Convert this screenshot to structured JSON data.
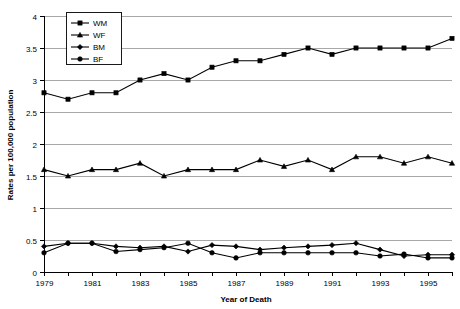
{
  "chart_data": {
    "type": "line",
    "title": "",
    "xlabel": "Year of Death",
    "ylabel": "Rates per 100,000 population",
    "x": [
      1979,
      1980,
      1981,
      1982,
      1983,
      1984,
      1985,
      1986,
      1987,
      1988,
      1989,
      1990,
      1991,
      1992,
      1993,
      1994,
      1995,
      1996
    ],
    "xtick_labels": [
      "1979",
      "1981",
      "1983",
      "1985",
      "1987",
      "1989",
      "1991",
      "1993",
      "1995"
    ],
    "xtick_values": [
      1979,
      1981,
      1983,
      1985,
      1987,
      1989,
      1991,
      1993,
      1995
    ],
    "ytick_labels": [
      "0",
      "0.5",
      "1",
      "1.5",
      "2",
      "2.5",
      "3",
      "3.5",
      "4"
    ],
    "ytick_values": [
      0,
      0.5,
      1,
      1.5,
      2,
      2.5,
      3,
      3.5,
      4
    ],
    "xlim": [
      1979,
      1996
    ],
    "ylim": [
      0,
      4
    ],
    "grid": true,
    "legend_position": "top-left",
    "series": [
      {
        "name": "WM",
        "marker": "square",
        "values": [
          2.8,
          2.7,
          2.8,
          2.8,
          3.0,
          3.1,
          3.0,
          3.2,
          3.3,
          3.3,
          3.4,
          3.5,
          3.4,
          3.5,
          3.5,
          3.5,
          3.5,
          3.65
        ]
      },
      {
        "name": "WF",
        "marker": "triangle",
        "values": [
          1.6,
          1.5,
          1.6,
          1.6,
          1.7,
          1.5,
          1.6,
          1.6,
          1.6,
          1.75,
          1.65,
          1.75,
          1.6,
          1.8,
          1.8,
          1.7,
          1.8,
          1.7
        ]
      },
      {
        "name": "BM",
        "marker": "diamond",
        "values": [
          0.4,
          0.45,
          0.45,
          0.4,
          0.38,
          0.4,
          0.32,
          0.42,
          0.4,
          0.35,
          0.38,
          0.4,
          0.42,
          0.45,
          0.35,
          0.25,
          0.27,
          0.27
        ]
      },
      {
        "name": "BF",
        "marker": "circle",
        "values": [
          0.3,
          0.45,
          0.45,
          0.32,
          0.35,
          0.38,
          0.45,
          0.3,
          0.22,
          0.3,
          0.3,
          0.3,
          0.3,
          0.3,
          0.25,
          0.28,
          0.22,
          0.22
        ]
      }
    ]
  },
  "legend": {
    "items": [
      {
        "label": "WM"
      },
      {
        "label": "WF"
      },
      {
        "label": "BM"
      },
      {
        "label": "BF"
      }
    ]
  },
  "colors": {
    "series": "#000000",
    "grid": "#a8a8a8",
    "axis": "#000000",
    "background": "#ffffff"
  }
}
